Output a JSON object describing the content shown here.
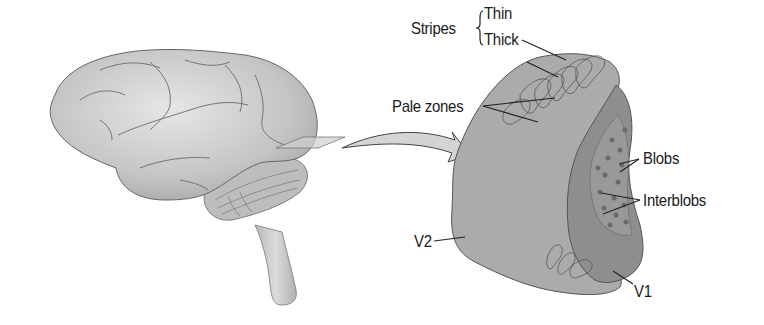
{
  "figure": {
    "type": "anatomical diagram",
    "colors": {
      "background": "#ffffff",
      "brain_fill": "#cfcfcf",
      "v2_fill": "#ababab",
      "v1_fill": "#8e8e8e",
      "blob_fill": "#6f6f6f",
      "outline": "#555555",
      "label_text": "#1a1a1a"
    }
  },
  "labels": {
    "stripes": "Stripes",
    "thin": "Thin",
    "thick": "Thick",
    "pale_zones": "Pale zones",
    "blobs": "Blobs",
    "interblobs": "Interblobs",
    "v2": "V2",
    "v1": "V1"
  }
}
